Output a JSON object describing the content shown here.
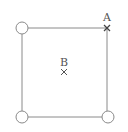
{
  "diagram": {
    "colors": {
      "line": "#8a8a8a",
      "marker": "#555555",
      "circle_fill": "#ffffff"
    },
    "nodes": [
      {
        "id": "top-left",
        "shape": "circle",
        "x": 22,
        "y": 28
      },
      {
        "id": "top-right",
        "shape": "cross",
        "x": 107,
        "y": 28
      },
      {
        "id": "bottom-left",
        "shape": "circle",
        "x": 22,
        "y": 117
      },
      {
        "id": "bottom-right",
        "shape": "circle",
        "x": 108,
        "y": 117
      }
    ],
    "points": [
      {
        "label": "A",
        "x": 107,
        "y": 28
      },
      {
        "label": "B",
        "x": 64,
        "y": 72
      }
    ]
  }
}
